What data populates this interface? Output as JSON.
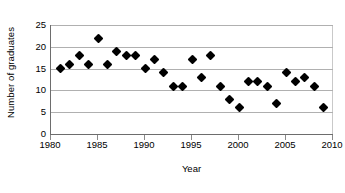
{
  "chart_data": {
    "type": "scatter",
    "title": "",
    "xlabel": "Year",
    "ylabel": "Number of graduates",
    "xlim": [
      1980,
      2010
    ],
    "ylim": [
      0,
      25
    ],
    "xticks": [
      1980,
      1985,
      1990,
      1995,
      2000,
      2005,
      2010
    ],
    "yticks": [
      0,
      5,
      10,
      15,
      20,
      25
    ],
    "grid": "horizontal",
    "legend": "none",
    "marker": "black-diamond",
    "x": [
      1981,
      1982,
      1983,
      1984,
      1985,
      1986,
      1987,
      1988,
      1989,
      1990,
      1991,
      1992,
      1993,
      1994,
      1995,
      1996,
      1997,
      1998,
      1999,
      2000,
      2001,
      2002,
      2003,
      2004,
      2005,
      2006,
      2007,
      2008,
      2009
    ],
    "values": [
      15,
      16,
      18,
      16,
      22,
      16,
      19,
      18,
      18,
      15,
      17,
      14,
      11,
      11,
      17,
      13,
      18,
      11,
      8,
      6,
      12,
      12,
      11,
      7,
      14,
      12,
      13,
      11,
      6
    ],
    "points": [
      {
        "x": 1981,
        "y": 15
      },
      {
        "x": 1982,
        "y": 16
      },
      {
        "x": 1983,
        "y": 18
      },
      {
        "x": 1984,
        "y": 16
      },
      {
        "x": 1985,
        "y": 22
      },
      {
        "x": 1986,
        "y": 16
      },
      {
        "x": 1987,
        "y": 19
      },
      {
        "x": 1988,
        "y": 18
      },
      {
        "x": 1989,
        "y": 18
      },
      {
        "x": 1990,
        "y": 15
      },
      {
        "x": 1991,
        "y": 17
      },
      {
        "x": 1992,
        "y": 14
      },
      {
        "x": 1993,
        "y": 11
      },
      {
        "x": 1994,
        "y": 11
      },
      {
        "x": 1995,
        "y": 17
      },
      {
        "x": 1996,
        "y": 13
      },
      {
        "x": 1997,
        "y": 18
      },
      {
        "x": 1998,
        "y": 11
      },
      {
        "x": 1999,
        "y": 8
      },
      {
        "x": 2000,
        "y": 6
      },
      {
        "x": 2001,
        "y": 12
      },
      {
        "x": 2002,
        "y": 12
      },
      {
        "x": 2003,
        "y": 11
      },
      {
        "x": 2004,
        "y": 7
      },
      {
        "x": 2005,
        "y": 14
      },
      {
        "x": 2006,
        "y": 12
      },
      {
        "x": 2007,
        "y": 13
      },
      {
        "x": 2008,
        "y": 11
      },
      {
        "x": 2009,
        "y": 6
      }
    ]
  },
  "colors": {
    "marker": "#000000",
    "gridline": "#b0b0b0",
    "axis": "#6d6d6d",
    "background": "#ffffff",
    "text": "#000000"
  }
}
